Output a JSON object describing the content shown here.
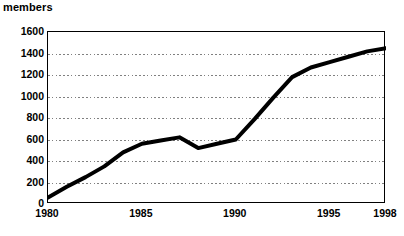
{
  "chart_data": {
    "type": "line",
    "title": "",
    "ylabel": "members",
    "xlabel": "",
    "ylim": [
      0,
      1600
    ],
    "xlim": [
      1980,
      1998
    ],
    "grid": true,
    "grid_axis": "y",
    "legend": false,
    "line_color": "#000000",
    "line_width_px": 4,
    "series": [
      {
        "name": "members",
        "x": [
          1980,
          1981,
          1982,
          1983,
          1984,
          1985,
          1986,
          1987,
          1988,
          1989,
          1990,
          1991,
          1992,
          1993,
          1994,
          1995,
          1996,
          1997,
          1998
        ],
        "values": [
          60,
          160,
          250,
          350,
          480,
          560,
          590,
          620,
          520,
          560,
          600,
          790,
          990,
          1180,
          1270,
          1320,
          1370,
          1420,
          1450
        ]
      }
    ],
    "y_ticks": [
      0,
      200,
      400,
      600,
      800,
      1000,
      1200,
      1400,
      1600
    ],
    "y_tick_labels": [
      "0",
      "200",
      "400",
      "600",
      "800",
      "1000",
      "1200",
      "1400",
      "1600"
    ],
    "x_ticks": [
      1980,
      1985,
      1990,
      1995,
      1998
    ],
    "x_tick_labels": [
      "1980",
      "1985",
      "1990",
      "1995",
      "1998"
    ]
  },
  "axis_title": "members",
  "colors": {
    "line": "#000000",
    "frame": "#000000",
    "grid": "#808080",
    "background": "#ffffff"
  }
}
